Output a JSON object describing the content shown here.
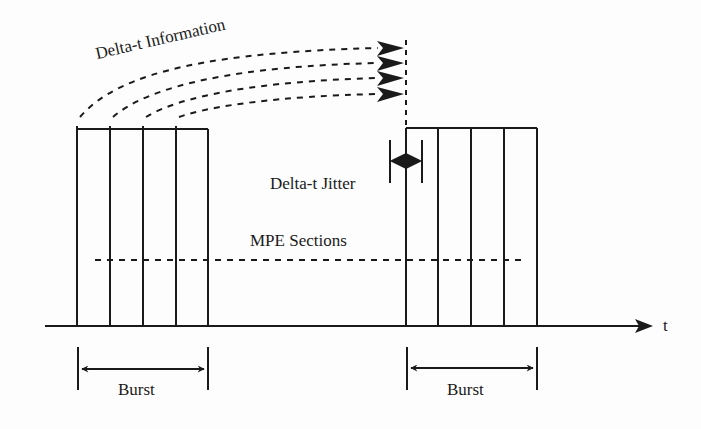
{
  "diagram": {
    "type": "timing-diagram",
    "labels": {
      "delta_t_information": "Delta-t Information",
      "delta_t_jitter": "Delta-t Jitter",
      "mpe_sections": "MPE Sections",
      "burst_left": "Burst",
      "burst_right": "Burst",
      "time_axis": "t"
    },
    "bursts": [
      {
        "name": "Burst",
        "sections": 4,
        "x_start": 77,
        "x_end": 208
      },
      {
        "name": "Burst",
        "sections": 4,
        "x_start": 406,
        "x_end": 537
      }
    ],
    "colors": {
      "line": "#1a1a1a",
      "background": "#fdfdfd"
    }
  }
}
